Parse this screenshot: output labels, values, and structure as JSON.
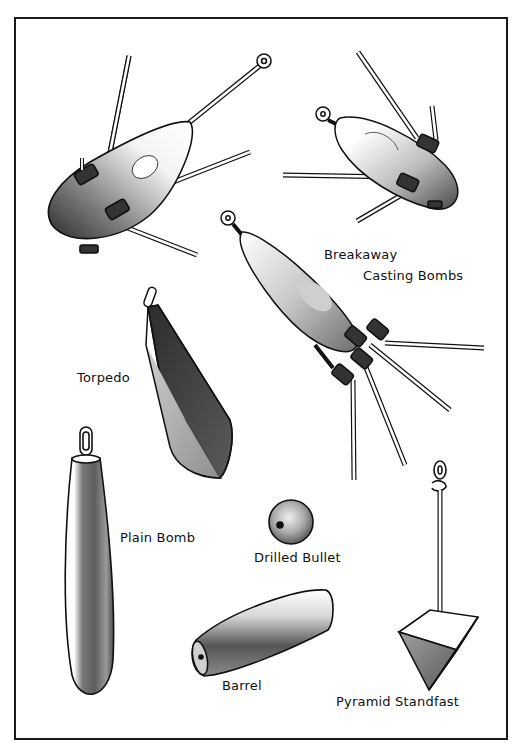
{
  "labels": {
    "breakaway_line1": "Breakaway",
    "breakaway_line2": "Casting Bombs",
    "torpedo": "Torpedo",
    "plain_bomb": "Plain Bomb",
    "drilled_bullet": "Drilled Bullet",
    "barrel": "Barrel",
    "pyramid": "Pyramid Standfast"
  },
  "items": [
    {
      "name": "Breakaway Casting Bomb (large)",
      "position": "top-left"
    },
    {
      "name": "Breakaway Casting Bomb (small)",
      "position": "top-right"
    },
    {
      "name": "Breakaway Casting Bomb (center)",
      "position": "center-right"
    },
    {
      "name": "Torpedo",
      "position": "middle-left"
    },
    {
      "name": "Plain Bomb",
      "position": "bottom-left"
    },
    {
      "name": "Drilled Bullet",
      "position": "bottom-center"
    },
    {
      "name": "Barrel",
      "position": "bottom-center"
    },
    {
      "name": "Pyramid Standfast",
      "position": "bottom-right"
    }
  ],
  "colors": {
    "ink": "#111111",
    "stipple_dark": "#3a3a3a",
    "stipple_light": "#d8d8d8",
    "paper": "#ffffff"
  }
}
